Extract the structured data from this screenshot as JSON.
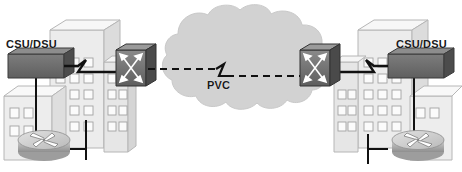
{
  "diagram": {
    "background_color": "#ffffff",
    "cloud": {
      "name": "wan-cloud",
      "fill": "#d2d2d2",
      "stroke": "#c0c0c0"
    },
    "link": {
      "pvc_label": "PVC",
      "style": "dashed",
      "color": "#111111"
    },
    "sites": [
      {
        "id": "left",
        "csudsu_label": "CSU/DSU",
        "device_names": [
          "csu-dsu",
          "router",
          "frame-relay-switch"
        ],
        "building_fill": "#e9e9e9"
      },
      {
        "id": "right",
        "csudsu_label": "CSU/DSU",
        "device_names": [
          "csu-dsu",
          "router",
          "frame-relay-switch"
        ],
        "building_fill": "#e9e9e9"
      }
    ],
    "colors": {
      "building_face": "#e9e9e9",
      "building_top": "#f6f6f6",
      "building_side": "#d7d7d7",
      "window": "#fbfbfb",
      "window_stroke": "#9a9a9a",
      "device_dark": "#6e6e6e",
      "device_dark_top": "#8e8e8e",
      "device_dark_side": "#4f4f4f",
      "router_body": "#b8b8b8",
      "router_top": "#d6d6d6",
      "line": "#111111",
      "text": "#1a1a1a"
    }
  }
}
